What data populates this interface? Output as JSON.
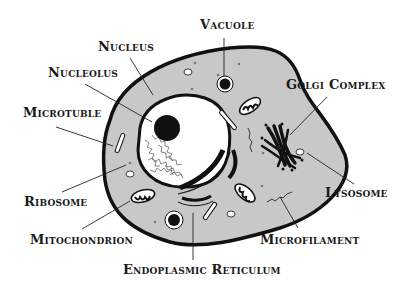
{
  "diagram": {
    "colors": {
      "cytoplasm": "#c8c8c8",
      "outline": "#111111",
      "nucleus_fill": "#ffffff",
      "background": "#ffffff"
    },
    "labels": {
      "vacuole": "Vacuole",
      "nucleus": "Nucleus",
      "nucleolus": "Nucleolus",
      "golgi_complex": "Golgi Complex",
      "microtuble": "Microtuble",
      "ribosome": "Ribosome",
      "lysosome": "Lysosome",
      "mitochondrion": "Mitochondrion",
      "microfilament": "Microfilament",
      "endoplasmic_reticulum": "Endoplasmic Reticulum"
    }
  }
}
